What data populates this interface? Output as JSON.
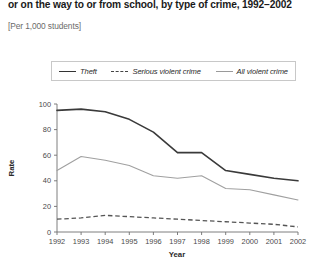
{
  "figure": {
    "title": "or on the way to or from school, by type of crime, 1992–2002",
    "subtitle": "[Per 1,000 students]"
  },
  "legend": {
    "position": "top-inside",
    "items": [
      {
        "label": "Theft",
        "style": "solid-dark",
        "color": "#3a3a3a"
      },
      {
        "label": "Serious violent crime",
        "style": "dashed",
        "color": "#555555"
      },
      {
        "label": "All violent crime",
        "style": "solid-light",
        "color": "#a0a0a0"
      }
    ]
  },
  "axes": {
    "ylabel": "Rate",
    "xlabel": "Year",
    "yticks": [
      "0",
      "20",
      "40",
      "60",
      "80",
      "100"
    ],
    "xticks": [
      "1992",
      "1993",
      "1994",
      "1995",
      "1996",
      "1997",
      "1998",
      "1999",
      "2000",
      "2001",
      "2002"
    ]
  },
  "chart_data": {
    "type": "line",
    "title": "or on the way to or from school, by type of crime, 1992–2002",
    "subtitle": "[Per 1,000 students]",
    "xlabel": "Year",
    "ylabel": "Rate",
    "x": [
      1992,
      1993,
      1994,
      1995,
      1996,
      1997,
      1998,
      1999,
      2000,
      2001,
      2002
    ],
    "categories": [
      "1992",
      "1993",
      "1994",
      "1995",
      "1996",
      "1997",
      "1998",
      "1999",
      "2000",
      "2001",
      "2002"
    ],
    "ylim": [
      0,
      100
    ],
    "yticks": [
      0,
      20,
      40,
      60,
      80,
      100
    ],
    "grid": false,
    "legend_position": "top-inside",
    "series": [
      {
        "name": "Theft",
        "color": "#3a3a3a",
        "style": "solid",
        "values": [
          95,
          96,
          94,
          88,
          78,
          62,
          62,
          48,
          45,
          42,
          40
        ]
      },
      {
        "name": "Serious violent crime",
        "color": "#555555",
        "style": "dashed",
        "values": [
          10,
          11,
          13,
          12,
          11,
          10,
          9,
          8,
          7,
          6,
          4
        ]
      },
      {
        "name": "All violent crime",
        "color": "#a0a0a0",
        "style": "solid",
        "values": [
          48,
          59,
          56,
          52,
          44,
          42,
          44,
          34,
          33,
          29,
          25
        ]
      }
    ]
  }
}
